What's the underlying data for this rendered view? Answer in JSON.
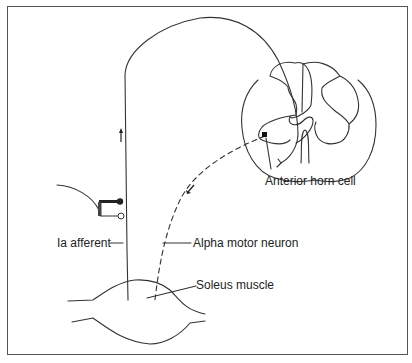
{
  "figure": {
    "type": "reflex arc schematic",
    "labels": {
      "anterior_horn_cell": "Anterior horn cell",
      "ia_afferent": "Ia afferent",
      "alpha_motor_neuron": "Alpha motor neuron",
      "soleus_muscle": "Soleus muscle"
    },
    "colors": {
      "stroke": "#333333",
      "frame": "#555555",
      "background": "#ffffff"
    }
  }
}
